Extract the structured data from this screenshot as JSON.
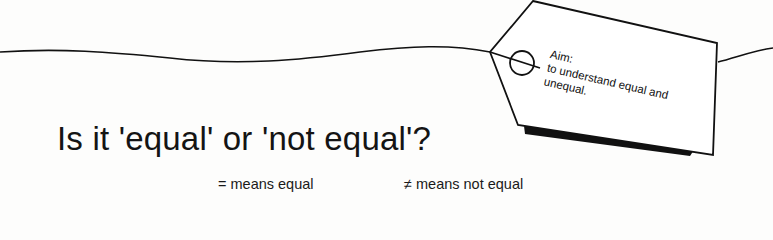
{
  "title": "Is it 'equal' or 'not equal'?",
  "tag": {
    "aim_label": "Aim:",
    "aim_line1": "to understand equal and",
    "aim_line2": "unequal."
  },
  "key": {
    "equal": "= means equal",
    "not_equal": "≠ means not equal"
  }
}
